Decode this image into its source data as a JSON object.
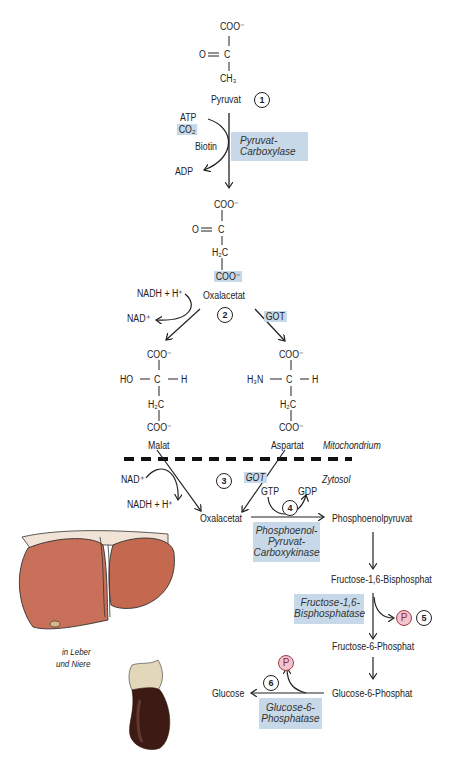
{
  "compartments": {
    "mitochondrium": "Mitochondrium",
    "zytosol": "Zytosol"
  },
  "organs_label": {
    "line1": "in Leber",
    "line2": "und Niere"
  },
  "colors": {
    "enzyme_box": "#c7d9e8",
    "phosphate_fill": "#f2c4cc",
    "phosphate_stroke": "#a23a4a",
    "liver": "#c8705a",
    "kidney": "#3d1a14",
    "line": "#222222"
  },
  "structures": {
    "pyruvat": {
      "top": "COO⁻",
      "mid_left": "O",
      "mid_c": "C",
      "bottom": "CH₃",
      "name": "Pyruvat"
    },
    "oxalacetat": {
      "top": "COO⁻",
      "mid_left": "O",
      "mid_c": "C",
      "ch2": "H₂C",
      "bottom": "COO⁻",
      "name": "Oxalacetat"
    },
    "malat": {
      "top": "COO⁻",
      "left": "HO",
      "c": "C",
      "right": "H",
      "ch2": "H₂C",
      "bottom": "COO⁻",
      "name": "Malat"
    },
    "aspartat": {
      "top": "COO⁻",
      "left": "H₃N",
      "c": "C",
      "right": "H",
      "ch2": "H₂C",
      "bottom": "COO⁻",
      "name": "Aspartat"
    }
  },
  "cofactors": {
    "atp": "ATP",
    "co2": "CO₂",
    "biotin": "Biotin",
    "adp": "ADP",
    "nadh_in": "NADH + H⁺",
    "nad_out": "NAD⁺",
    "nad_in": "NAD⁺",
    "nadh_out": "NADH + H⁺",
    "gtp": "GTP",
    "gdp": "GDP",
    "phosphate": "P"
  },
  "enzymes": {
    "pyruvat_carboxylase": [
      "Pyruvat-",
      "Carboxylase"
    ],
    "got_mito": "GOT",
    "got_cyto": "GOT",
    "pepck": [
      "Phosphoenol-",
      "Pyruvat-",
      "Carboxykinase"
    ],
    "fbpase": [
      "Fructose-1,6-",
      "Bisphosphatase"
    ],
    "g6pase": [
      "Glucose-6-",
      "Phosphatase"
    ]
  },
  "metabolites": {
    "oxalacetat_cyto": "Oxalacetat",
    "pep": "Phosphoenolpyruvat",
    "f16bp": "Fructose-1,6-Bisphosphat",
    "f6p": "Fructose-6-Phosphat",
    "g6p": "Glucose-6-Phosphat",
    "glucose": "Glucose"
  },
  "steps": [
    "1",
    "2",
    "3",
    "4",
    "5",
    "6"
  ]
}
